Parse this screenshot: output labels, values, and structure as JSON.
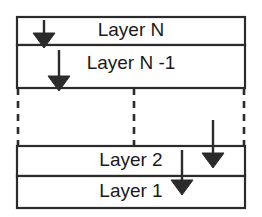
{
  "diagram": {
    "type": "layered-stack",
    "colors": {
      "stroke": "#2b2b2b",
      "fill": "#ffffff",
      "text": "#1a1a1a",
      "arrow": "#2b2b2b",
      "background": "#ffffff"
    },
    "frame": {
      "x": 17,
      "y": 17,
      "width": 228,
      "height": 191
    },
    "layers": [
      {
        "id": "layer-n",
        "label": "Layer N",
        "y": 17,
        "height": 28,
        "style": "solid",
        "label_x": 131,
        "label_y": 31
      },
      {
        "id": "layer-n-1",
        "label": "Layer N -1",
        "y": 45,
        "height": 43,
        "style": "solid",
        "label_x": 131,
        "label_y": 64
      },
      {
        "id": "layer-ellipsis",
        "label": "",
        "y": 88,
        "height": 58,
        "style": "dashed",
        "label_x": 131,
        "label_y": 117
      },
      {
        "id": "layer-2",
        "label": "Layer 2",
        "y": 146,
        "height": 30,
        "style": "solid",
        "label_x": 131,
        "label_y": 161
      },
      {
        "id": "layer-1",
        "label": "Layer 1",
        "y": 176,
        "height": 32,
        "style": "solid",
        "label_x": 131,
        "label_y": 192
      }
    ],
    "dashed_verticals": [
      {
        "id": "dashed-left",
        "x": 18,
        "y1": 88,
        "y2": 146
      },
      {
        "id": "dashed-middle",
        "x": 134,
        "y1": 88,
        "y2": 146
      },
      {
        "id": "dashed-right",
        "x": 244,
        "y1": 88,
        "y2": 146
      }
    ],
    "arrows": [
      {
        "id": "arrow-1",
        "x": 44,
        "y_start": 20,
        "y_end": 48,
        "direction": "down"
      },
      {
        "id": "arrow-2",
        "x": 59,
        "y_start": 50,
        "y_end": 91,
        "direction": "down"
      },
      {
        "id": "arrow-3",
        "x": 213,
        "y_start": 120,
        "y_end": 168,
        "direction": "down"
      },
      {
        "id": "arrow-4",
        "x": 182,
        "y_start": 150,
        "y_end": 195,
        "direction": "down"
      }
    ]
  }
}
